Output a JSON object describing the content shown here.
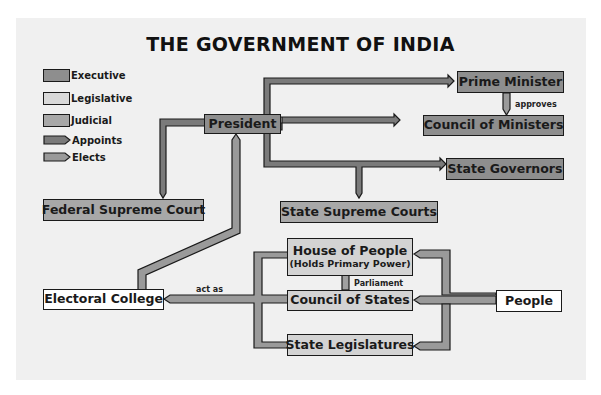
{
  "title": "THE GOVERNMENT OF INDIA",
  "colors": {
    "executive": "#8e8e8e",
    "legislative": "#d3d3d3",
    "judicial": "#a8a8a8",
    "appoints": "#7a7a7a",
    "elects": "#9a9a9a",
    "outline": "#1a1a1a",
    "panel": "#f0f0f0"
  },
  "legend": [
    {
      "label": "Executive",
      "type": "box",
      "color": "#8e8e8e"
    },
    {
      "label": "Legislative",
      "type": "box",
      "color": "#d3d3d3"
    },
    {
      "label": "Judicial",
      "type": "box",
      "color": "#a8a8a8"
    },
    {
      "label": "Appoints",
      "type": "arrow",
      "color": "#7a7a7a"
    },
    {
      "label": "Elects",
      "type": "arrow",
      "color": "#9a9a9a"
    }
  ],
  "nodes": {
    "president": {
      "label": "President",
      "branch": "Executive"
    },
    "prime_minister": {
      "label": "Prime Minister",
      "branch": "Executive"
    },
    "council_of_ministers": {
      "label": "Council of Ministers",
      "branch": "Executive"
    },
    "state_governors": {
      "label": "State Governors",
      "branch": "Executive"
    },
    "federal_supreme_court": {
      "label": "Federal Supreme Court",
      "branch": "Judicial"
    },
    "state_supreme_courts": {
      "label": "State Supreme Courts",
      "branch": "Judicial"
    },
    "house_of_people": {
      "label": "House of People",
      "sublabel": "(Holds Primary Power)",
      "branch": "Legislative"
    },
    "council_of_states": {
      "label": "Council of States",
      "branch": "Legislative"
    },
    "state_legislatures": {
      "label": "State Legislatures",
      "branch": "Legislative"
    },
    "electoral_college": {
      "label": "Electoral College"
    },
    "people": {
      "label": "People"
    }
  },
  "annotations": {
    "approves": "approves",
    "parliament": "Parliament",
    "act_as": "act as"
  },
  "edges": [
    {
      "from": "President",
      "to": "Prime Minister",
      "type": "Appoints"
    },
    {
      "from": "President",
      "to": "Council of Ministers",
      "type": "Appoints"
    },
    {
      "from": "President",
      "to": "State Governors",
      "type": "Appoints"
    },
    {
      "from": "President",
      "to": "State Supreme Courts",
      "type": "Appoints"
    },
    {
      "from": "President",
      "to": "Federal Supreme Court",
      "type": "Appoints"
    },
    {
      "from": "Prime Minister",
      "to": "Council of Ministers",
      "type": "Appoints",
      "label": "approves"
    },
    {
      "from": "Electoral College",
      "to": "President",
      "type": "Elects"
    },
    {
      "from": "People",
      "to": "House of People",
      "type": "Elects"
    },
    {
      "from": "People",
      "to": "Council of States",
      "type": "Elects"
    },
    {
      "from": "People",
      "to": "State Legislatures",
      "type": "Elects"
    },
    {
      "from": "Legislatures",
      "to": "Electoral College",
      "type": "Elects",
      "label": "act as"
    }
  ]
}
